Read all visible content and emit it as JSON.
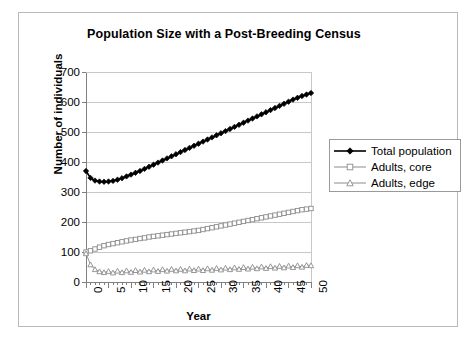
{
  "chart_data": {
    "type": "line",
    "title": "Population Size with a Post-Breeding Census",
    "xlabel": "Year",
    "ylabel": "Number of individuals",
    "xlim": [
      0,
      50
    ],
    "ylim": [
      0,
      700
    ],
    "ytick_step": 100,
    "xtick_label_step": 5,
    "xtick_minor_step": 1,
    "grid": "horizontal",
    "legend_position": "right",
    "ytick_labels": [
      "0",
      "100",
      "200",
      "300",
      "400",
      "500",
      "600",
      "700"
    ],
    "xtick_labels": [
      "0",
      "5",
      "10",
      "15",
      "20",
      "25",
      "30",
      "35",
      "40",
      "45",
      "50"
    ],
    "colors": {
      "total_population": "#000000",
      "adults_core": "#8c8c8c",
      "adults_edge": "#8c8c8c",
      "gridline": "#c8c8c8",
      "axis": "#808080",
      "frame": "#b9b9b9"
    },
    "x": [
      0,
      1,
      2,
      3,
      4,
      5,
      6,
      7,
      8,
      9,
      10,
      11,
      12,
      13,
      14,
      15,
      16,
      17,
      18,
      19,
      20,
      21,
      22,
      23,
      24,
      25,
      26,
      27,
      28,
      29,
      30,
      31,
      32,
      33,
      34,
      35,
      36,
      37,
      38,
      39,
      40,
      41,
      42,
      43,
      44,
      45,
      46,
      47,
      48,
      49,
      50
    ],
    "series": [
      {
        "name": "Total population",
        "marker": "diamond-filled",
        "values": [
          370,
          347,
          338,
          335,
          334,
          335,
          337,
          341,
          346,
          352,
          358,
          364,
          370,
          377,
          384,
          391,
          398,
          405,
          412,
          419,
          426,
          433,
          440,
          447,
          454,
          461,
          468,
          475,
          482,
          489,
          496,
          503,
          510,
          517,
          524,
          531,
          538,
          545,
          552,
          559,
          566,
          573,
          580,
          587,
          594,
          601,
          608,
          614,
          620,
          625,
          630
        ]
      },
      {
        "name": "Adults, core",
        "marker": "square-open",
        "values": [
          100,
          104,
          110,
          116,
          121,
          125,
          128,
          131,
          134,
          137,
          140,
          142,
          145,
          147,
          150,
          152,
          154,
          156,
          158,
          160,
          162,
          164,
          166,
          168,
          170,
          172,
          175,
          178,
          181,
          184,
          187,
          190,
          193,
          196,
          199,
          202,
          205,
          208,
          211,
          214,
          217,
          220,
          223,
          226,
          229,
          232,
          235,
          238,
          241,
          243,
          245
        ]
      },
      {
        "name": "Adults, edge",
        "marker": "triangle-open",
        "values": [
          95,
          58,
          42,
          35,
          32,
          36,
          31,
          37,
          32,
          38,
          33,
          39,
          34,
          40,
          35,
          41,
          36,
          42,
          37,
          43,
          38,
          43,
          38,
          44,
          39,
          44,
          39,
          45,
          40,
          46,
          41,
          47,
          42,
          48,
          43,
          49,
          44,
          50,
          45,
          51,
          46,
          52,
          47,
          53,
          48,
          54,
          49,
          55,
          50,
          56,
          55
        ]
      }
    ]
  },
  "legend": {
    "items": [
      {
        "label": "Total population",
        "marker": "diamond-filled"
      },
      {
        "label": "Adults, core",
        "marker": "square-open"
      },
      {
        "label": "Adults, edge",
        "marker": "triangle-open"
      }
    ]
  }
}
